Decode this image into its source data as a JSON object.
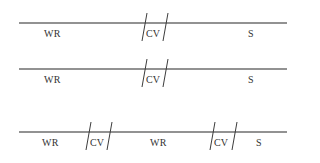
{
  "diagram": {
    "rows": [
      {
        "line_y": 23,
        "label_y": 29,
        "segments": [
          {
            "label": "WR",
            "x": 44
          },
          {
            "label": "CV",
            "x": 146
          },
          {
            "label": "S",
            "x": 248
          }
        ],
        "slashes": [
          {
            "x_top": 147,
            "x_bottom": 142
          },
          {
            "x_top": 168,
            "x_bottom": 163
          }
        ]
      },
      {
        "line_y": 69,
        "label_y": 75,
        "segments": [
          {
            "label": "WR",
            "x": 44
          },
          {
            "label": "CV",
            "x": 146
          },
          {
            "label": "S",
            "x": 248
          }
        ],
        "slashes": [
          {
            "x_top": 147,
            "x_bottom": 142
          },
          {
            "x_top": 168,
            "x_bottom": 163
          }
        ]
      },
      {
        "line_y": 132,
        "label_y": 138,
        "segments": [
          {
            "label": "WR",
            "x": 42
          },
          {
            "label": "CV",
            "x": 90
          },
          {
            "label": "WR",
            "x": 150
          },
          {
            "label": "CV",
            "x": 214
          },
          {
            "label": "S",
            "x": 256
          }
        ],
        "slashes": [
          {
            "x_top": 91,
            "x_bottom": 86
          },
          {
            "x_top": 112,
            "x_bottom": 107
          },
          {
            "x_top": 215,
            "x_bottom": 210
          },
          {
            "x_top": 237,
            "x_bottom": 232
          }
        ]
      }
    ],
    "line_x_start": 19,
    "line_x_end": 287
  }
}
